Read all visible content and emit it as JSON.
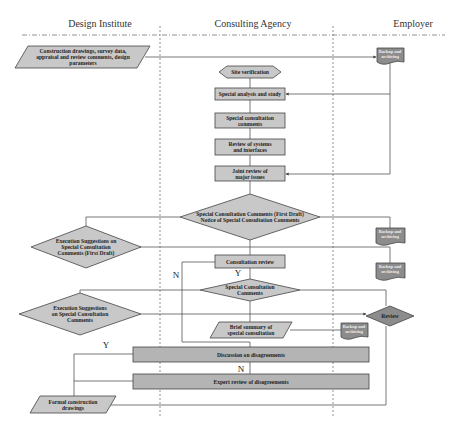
{
  "lanes": [
    {
      "label": "Design Institute"
    },
    {
      "label": "Consulting Agency"
    },
    {
      "label": "Employer"
    }
  ],
  "nodes": {
    "input_data": {
      "label": "Construction drawings, survey data, appraisal and review comments, design parameters",
      "shape": "parallelogram"
    },
    "backup_1": {
      "label": "Backup and archiving",
      "shape": "document"
    },
    "site_verification": {
      "label": "Site verification",
      "shape": "hexagon"
    },
    "special_analysis": {
      "label": "Special analysis and study",
      "shape": "process"
    },
    "special_comments": {
      "label": "Special consultation comments",
      "shape": "process"
    },
    "review_systems": {
      "label": "Review of systems and interfaces",
      "shape": "process"
    },
    "joint_review": {
      "label": "Joint review of major issues",
      "shape": "process"
    },
    "first_draft_decision": {
      "label": "Special Consultation Comments (First Draft) Notice of Special Consultation Comments",
      "shape": "decision"
    },
    "backup_2": {
      "label": "Backup and archiving",
      "shape": "document"
    },
    "backup_3": {
      "label": "Backup and archiving",
      "shape": "document"
    },
    "exec_suggestions_first": {
      "label": "Execution Suggestions on Special Consultation Comments (First Draft)",
      "shape": "decision"
    },
    "consultation_review": {
      "label": "Consultation review",
      "shape": "process"
    },
    "special_comments_decision": {
      "label": "Special Consultation Comments",
      "shape": "decision"
    },
    "review": {
      "label": "Review",
      "shape": "decision"
    },
    "exec_suggestions": {
      "label": "Execution Suggestions on Special Consultation Comments",
      "shape": "decision"
    },
    "brief_summary": {
      "label": "Brief summary of special consultation",
      "shape": "parallelogram"
    },
    "backup_4": {
      "label": "Backup and archiving",
      "shape": "document"
    },
    "discussion": {
      "label": "Discussion on disagreements",
      "shape": "process"
    },
    "expert_review": {
      "label": "Expert review of disagreements",
      "shape": "process"
    },
    "formal_drawings": {
      "label": "Formal construction drawings",
      "shape": "parallelogram"
    }
  },
  "edge_labels": {
    "n_left": "N",
    "y_consult": "Y",
    "y_discussion": "Y",
    "n_discussion": "N"
  },
  "colors": {
    "shape_fill": "#c8c8c8",
    "doc_fill": "#8c8c8c",
    "stroke": "#444444",
    "line": "#555555",
    "divider": "#777777"
  }
}
